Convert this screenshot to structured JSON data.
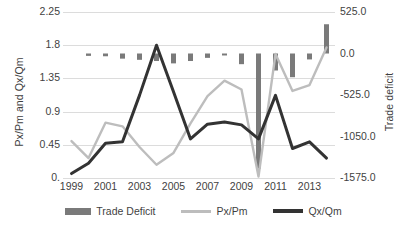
{
  "chart_data": {
    "type": "bar",
    "title": "",
    "xlabel": "",
    "ylabel": "Px/Pm and Qx/Qm",
    "y2label": "Trade deficit",
    "grid": true,
    "legend_position": "bottom",
    "x": [
      1999,
      2000,
      2001,
      2002,
      2003,
      2004,
      2005,
      2006,
      2007,
      2008,
      2009,
      2010,
      2011,
      2012,
      2013,
      2014
    ],
    "categories": [
      "1999",
      "2000",
      "2001",
      "2002",
      "2003",
      "2004",
      "2005",
      "2006",
      "2007",
      "2008",
      "2009",
      "2010",
      "2011",
      "2012",
      "2013",
      "2014"
    ],
    "xtick_labels": [
      "1999",
      "2001",
      "2003",
      "2005",
      "2007",
      "2009",
      "2011",
      "2013"
    ],
    "ylim": [
      0,
      2.25
    ],
    "ytick_labels": [
      "2.25",
      "1.8",
      "1.35",
      "0.9",
      "0.45",
      "0."
    ],
    "ytick_values": [
      2.25,
      1.8,
      1.35,
      0.9,
      0.45,
      0
    ],
    "y2lim": [
      -1575.0,
      525.0
    ],
    "y2tick_labels": [
      "525.0",
      "0.0",
      "-525.0",
      "-1050.0",
      "-1575.0"
    ],
    "y2tick_values": [
      525.0,
      0.0,
      -525.0,
      -1050.0,
      -1575.0
    ],
    "series": [
      {
        "name": "Trade Deficit",
        "type": "bar",
        "axis": "right",
        "color": "#7a7a7a",
        "values": [
          0,
          -30,
          -35,
          -65,
          -80,
          -95,
          -125,
          -95,
          -55,
          -25,
          -135,
          -1455,
          -215,
          -300,
          -75,
          370
        ]
      },
      {
        "name": "Px/Pm",
        "type": "line",
        "axis": "left",
        "color": "#bdbdbd",
        "values": [
          0.5,
          0.27,
          0.75,
          0.7,
          0.42,
          0.18,
          0.34,
          0.74,
          1.11,
          1.32,
          1.2,
          0.02,
          1.68,
          1.18,
          1.26,
          1.77
        ]
      },
      {
        "name": "Qx/Qm",
        "type": "line",
        "axis": "left",
        "color": "#333333",
        "values": [
          0.06,
          0.2,
          0.47,
          0.49,
          1.12,
          1.8,
          1.17,
          0.53,
          0.73,
          0.76,
          0.72,
          0.53,
          1.12,
          0.4,
          0.49,
          0.27
        ]
      }
    ]
  },
  "legend": {
    "items": [
      {
        "label": "Trade Deficit",
        "marker": "bar-swatch",
        "color": "#7a7a7a"
      },
      {
        "label": "Px/Pm",
        "marker": "line-swatch",
        "color": "#bdbdbd"
      },
      {
        "label": "Qx/Qm",
        "marker": "line-swatch",
        "color": "#333333"
      }
    ]
  }
}
